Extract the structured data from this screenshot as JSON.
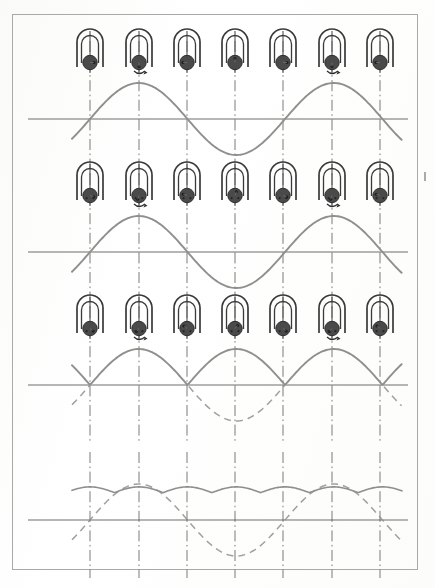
{
  "document": {
    "title": "AC to DC Commutation Waveform Diagram",
    "page_kind": "scanned-textbook-figure",
    "border_color": "#a9a9a6",
    "background_color": "#fdfdfc"
  },
  "figure": {
    "glyph_name": "generator-armature-icon",
    "glyph_count_per_row": 7,
    "glyph_centers_x": [
      90,
      139,
      187,
      235,
      283,
      332,
      380
    ],
    "axis_color": "#6f6f6c",
    "wave_color": "#8f8f8c",
    "dash_line_color": "#55554f",
    "rotor_fill": "#4a4a4a",
    "magnet_stroke": "#3a3a3a"
  },
  "chart_data": [
    {
      "type": "line",
      "title": "Row 1 — Single-loop AC output (slip rings)",
      "xlabel": "",
      "ylabel": "",
      "x_unit": "rotor position (degrees)",
      "baseline_y": 119,
      "amplitude": 36,
      "period_px": 195,
      "phase_deg": 0,
      "series": [
        {
          "name": "ac-sine",
          "style": "solid",
          "cycles": 2,
          "values_deg": [
            0,
            45,
            90,
            135,
            180,
            225,
            270,
            315,
            360
          ],
          "values_norm": [
            0,
            0.707,
            1,
            0.707,
            0,
            -0.707,
            -1,
            -0.707,
            0
          ]
        }
      ],
      "grid": false,
      "legend": "none"
    },
    {
      "type": "line",
      "title": "Row 2 — Single-loop AC output (repeat, commutator shown)",
      "xlabel": "",
      "ylabel": "",
      "x_unit": "rotor position (degrees)",
      "baseline_y": 252,
      "amplitude": 36,
      "period_px": 195,
      "phase_deg": 0,
      "series": [
        {
          "name": "ac-sine",
          "style": "solid",
          "cycles": 2,
          "values_deg": [
            0,
            45,
            90,
            135,
            180,
            225,
            270,
            315,
            360
          ],
          "values_norm": [
            0,
            0.707,
            1,
            0.707,
            0,
            -0.707,
            -1,
            -0.707,
            0
          ]
        }
      ],
      "grid": false,
      "legend": "none"
    },
    {
      "type": "line",
      "title": "Row 3 — Commutated (full-wave rectified) output",
      "xlabel": "",
      "ylabel": "",
      "x_unit": "rotor position (degrees)",
      "baseline_y": 385,
      "amplitude": 36,
      "period_px": 195,
      "phase_deg": 0,
      "series": [
        {
          "name": "rectified-sine",
          "style": "solid",
          "cycles": 2,
          "values_deg": [
            0,
            45,
            90,
            135,
            180,
            225,
            270,
            315,
            360
          ],
          "values_norm": [
            0,
            0.707,
            1,
            0.707,
            0,
            0.707,
            1,
            0.707,
            0
          ]
        },
        {
          "name": "suppressed-negative-half",
          "style": "dashed",
          "cycles": 2,
          "values_deg": [
            180,
            225,
            270,
            315,
            360
          ],
          "values_norm": [
            0,
            -0.707,
            -1,
            -0.707,
            0
          ]
        }
      ],
      "grid": false,
      "legend": "none"
    },
    {
      "type": "line",
      "title": "Row 4 — Multi-coil smoothed DC output with residual ripple",
      "xlabel": "",
      "ylabel": "",
      "x_unit": "rotor position (degrees)",
      "baseline_y": 520,
      "amplitude": 36,
      "ripple_amplitude": 6,
      "ripple_count": 8,
      "period_px": 195,
      "phase_deg": 0,
      "series": [
        {
          "name": "smoothed-dc-ripple",
          "style": "solid",
          "dc_level_norm": 0.92,
          "ripple_norm": 0.16
        },
        {
          "name": "underlying-sine",
          "style": "dashed",
          "cycles": 2,
          "values_deg": [
            0,
            45,
            90,
            135,
            180,
            225,
            270,
            315,
            360
          ],
          "values_norm": [
            0,
            0.707,
            1,
            0.707,
            0,
            -0.707,
            -1,
            -0.707,
            0
          ]
        }
      ],
      "grid": false,
      "legend": "none"
    }
  ],
  "marks": {
    "edge_tick_present": true
  }
}
